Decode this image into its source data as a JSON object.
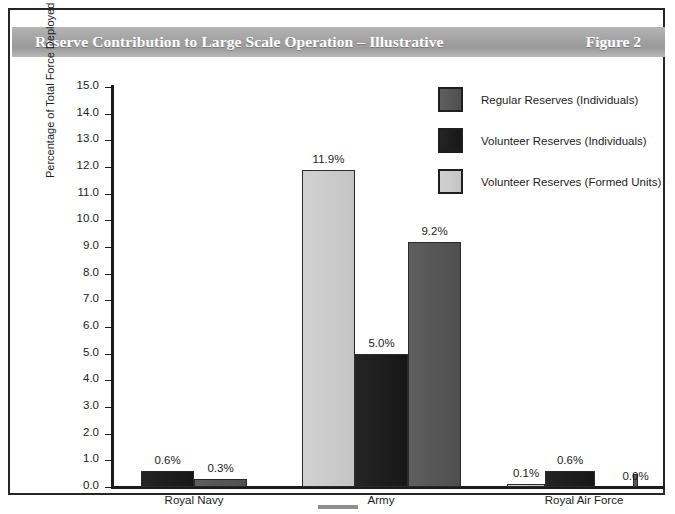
{
  "figure": {
    "title": "Reserve Contribution to Large Scale Operation – Illustrative",
    "figure_number": "Figure 2"
  },
  "colors": {
    "regular_reserves": "#555555",
    "volunteer_individuals": "#1c1c1c",
    "volunteer_formed_units": "#c8c8c8",
    "title_bar": "#a2a2a2",
    "axis": "#1a1a1a",
    "frame": "#262626"
  },
  "legend": {
    "items": [
      {
        "label": "Regular Reserves (Individuals)",
        "key": "regular",
        "swatch": "#555555"
      },
      {
        "label": "Volunteer Reserves (Individuals)",
        "key": "volunteer-ind",
        "swatch": "#1c1c1c"
      },
      {
        "label": "Volunteer Reserves (Formed Units)",
        "key": "volunteer-formed",
        "swatch": "#c8c8c8"
      }
    ]
  },
  "axes": {
    "y_title": "Percentage of Total Force Deployed",
    "y_ticks": [
      "15.0",
      "14.0",
      "13.0",
      "12.0",
      "11.0",
      "10.0",
      "9.0",
      "8.0",
      "7.0",
      "6.0",
      "5.0",
      "4.0",
      "3.0",
      "2.0",
      "1.0",
      "0.0"
    ],
    "y_min": 0,
    "y_max": 15,
    "y_step": 1
  },
  "chart_data": {
    "type": "bar",
    "title": "Reserve Contribution to Large Scale Operation – Illustrative",
    "xlabel": "",
    "ylabel": "Percentage of Total Force Deployed",
    "ylim": [
      0,
      15
    ],
    "ytick_step": 1,
    "grid": false,
    "legend_position": "top-right",
    "value_label_format": "percent-one-decimal",
    "categories": [
      "Royal Navy",
      "Army",
      "Royal Air Force"
    ],
    "series": [
      {
        "name": "Volunteer Reserves (Formed Units)",
        "values": [
          null,
          11.9,
          0.1
        ],
        "labels": [
          "",
          "11.9%",
          "0.1%"
        ]
      },
      {
        "name": "Volunteer Reserves (Individuals)",
        "values": [
          0.6,
          5.0,
          0.6
        ],
        "labels": [
          "0.6%",
          "5.0%",
          "0.6%"
        ]
      },
      {
        "name": "Regular Reserves (Individuals)",
        "values": [
          0.3,
          9.2,
          0.0
        ],
        "labels": [
          "0.3%",
          "9.2%",
          "0.0%"
        ]
      }
    ],
    "bars": [
      {
        "category": "Royal Navy",
        "series": "Volunteer Reserves (Individuals)",
        "key": "volunteer-ind",
        "value": 0.6,
        "label": "0.6%",
        "x": 28,
        "width": 53
      },
      {
        "category": "Royal Navy",
        "series": "Regular Reserves (Individuals)",
        "key": "regular",
        "value": 0.3,
        "label": "0.3%",
        "x": 81,
        "width": 53
      },
      {
        "category": "Army",
        "series": "Volunteer Reserves (Formed Units)",
        "key": "volunteer-formed",
        "value": 11.9,
        "label": "11.9%",
        "x": 189,
        "width": 53
      },
      {
        "category": "Army",
        "series": "Volunteer Reserves (Individuals)",
        "key": "volunteer-ind",
        "value": 5.0,
        "label": "5.0%",
        "x": 242,
        "width": 53
      },
      {
        "category": "Army",
        "series": "Regular Reserves (Individuals)",
        "key": "regular",
        "value": 9.2,
        "label": "9.2%",
        "x": 295,
        "width": 53
      },
      {
        "category": "Royal Air Force",
        "series": "Volunteer Reserves (Formed Units)",
        "key": "volunteer-formed",
        "value": 0.1,
        "label": "0.1%",
        "x": 394,
        "width": 38
      },
      {
        "category": "Royal Air Force",
        "series": "Volunteer Reserves (Individuals)",
        "key": "volunteer-ind",
        "value": 0.6,
        "label": "0.6%",
        "x": 432,
        "width": 50
      },
      {
        "category": "Royal Air Force",
        "series": "Regular Reserves (Individuals)",
        "key": "regular",
        "value": 0.0,
        "label": "0.0%",
        "x": 520,
        "width": 5
      }
    ],
    "category_positions": [
      81,
      268,
      471
    ]
  }
}
